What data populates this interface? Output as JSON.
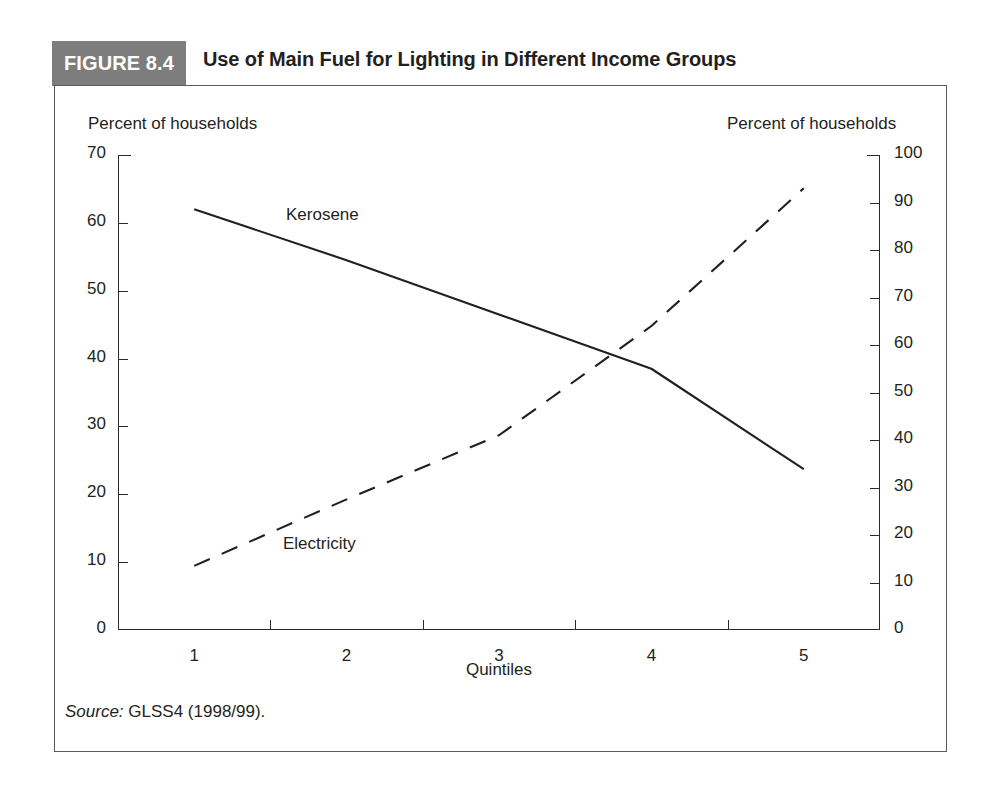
{
  "figure": {
    "badge_label": "FIGURE 8.4",
    "title": "Use of Main Fuel for Lighting in Different Income Groups",
    "badge_color": "#7d7d7d",
    "border_color": "#5a5a5a"
  },
  "source": {
    "prefix": "Source:",
    "text": " GLSS4 (1998/99)."
  },
  "chart_data": {
    "type": "line",
    "title": "Use of Main Fuel for Lighting in Different Income Groups",
    "xlabel": "Quintiles",
    "ylabel": "Percent of households",
    "y2label": "Percent of households",
    "categories": [
      "1",
      "2",
      "3",
      "4",
      "5"
    ],
    "x": [
      1,
      2,
      3,
      4,
      5
    ],
    "ylim": [
      0,
      70
    ],
    "y2lim": [
      0,
      100
    ],
    "yticks": [
      0,
      10,
      20,
      30,
      40,
      50,
      60,
      70
    ],
    "y2ticks": [
      0,
      10,
      20,
      30,
      40,
      50,
      60,
      70,
      80,
      90,
      100
    ],
    "grid": false,
    "legend": "inline-annotations",
    "series": [
      {
        "name": "Kerosene",
        "axis": "left",
        "style": "solid",
        "color": "#231f20",
        "values": [
          62.0,
          54.5,
          46.5,
          38.5,
          23.7
        ]
      },
      {
        "name": "Electricity",
        "axis": "right",
        "style": "dashed",
        "color": "#231f20",
        "values": [
          13.5,
          27.5,
          41.0,
          64.0,
          93.0
        ]
      }
    ],
    "annotations": [
      {
        "label": "Kerosene",
        "series": "Kerosene"
      },
      {
        "label": "Electricity",
        "series": "Electricity"
      }
    ]
  },
  "axes": {
    "left_header": "Percent of households",
    "right_header": "Percent of households",
    "x_title": "Quintiles",
    "left_ticks": [
      "70",
      "60",
      "50",
      "40",
      "30",
      "20",
      "10",
      "0"
    ],
    "right_ticks": [
      "100",
      "90",
      "80",
      "70",
      "60",
      "50",
      "40",
      "30",
      "20",
      "10",
      "0"
    ],
    "x_ticks": [
      "1",
      "2",
      "3",
      "4",
      "5"
    ]
  }
}
